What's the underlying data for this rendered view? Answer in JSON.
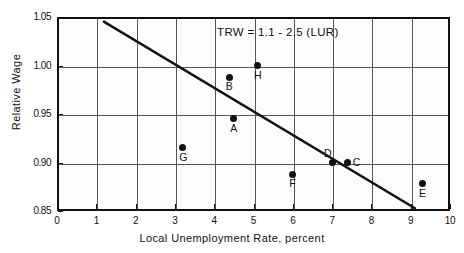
{
  "chart_data": {
    "type": "scatter",
    "title": "",
    "xlabel": "Local  Unemployment  Rate,  percent",
    "ylabel": "Relative  Wage",
    "xlim": [
      0,
      10
    ],
    "ylim": [
      0.85,
      1.05
    ],
    "xticks": [
      "0",
      "1",
      "2",
      "3",
      "4",
      "5",
      "6",
      "7",
      "8",
      "9",
      "10"
    ],
    "xtick_values": [
      0,
      1,
      2,
      3,
      4,
      5,
      6,
      7,
      8,
      9,
      10
    ],
    "yticks": [
      "1.05",
      "1.00",
      "0.95",
      "0.90",
      "0.85"
    ],
    "ytick_values": [
      1.05,
      1.0,
      0.95,
      0.9,
      0.85
    ],
    "grid": "both",
    "grid_x_values": [
      1,
      2,
      3,
      4,
      5,
      6,
      7,
      8,
      9
    ],
    "grid_y_values": [
      1.0,
      0.95,
      0.9
    ],
    "legend": "none",
    "annotations": [
      {
        "name": "regression-equation",
        "text": "TRW = 1.1 - 2.5 (LUR)",
        "x": 5.6,
        "y": 1.032
      }
    ],
    "points": [
      {
        "label": "A",
        "x": 4.5,
        "y": 0.945,
        "label_pos": "below"
      },
      {
        "label": "B",
        "x": 4.38,
        "y": 0.988,
        "label_pos": "below"
      },
      {
        "label": "C",
        "x": 7.4,
        "y": 0.9,
        "label_pos": "right"
      },
      {
        "label": "D",
        "x": 7.0,
        "y": 0.9,
        "label_pos": "above-left"
      },
      {
        "label": "E",
        "x": 9.3,
        "y": 0.878,
        "label_pos": "below"
      },
      {
        "label": "F",
        "x": 6.0,
        "y": 0.888,
        "label_pos": "below"
      },
      {
        "label": "G",
        "x": 3.2,
        "y": 0.915,
        "label_pos": "below"
      },
      {
        "label": "H",
        "x": 5.1,
        "y": 1.0,
        "label_pos": "below"
      }
    ],
    "series": [
      {
        "name": "regression-line",
        "type": "line",
        "equation": "TRW = 1.1 - 2.5 (LUR)",
        "intercept": 1.1,
        "slope": -0.025,
        "x": [
          1.2,
          9.1
        ],
        "y": [
          1.045,
          0.853
        ]
      }
    ],
    "colors": {
      "line": "#111111",
      "marker": "#111111",
      "axis": "#111111",
      "grid": "#555555",
      "background": "#ffffff"
    }
  }
}
